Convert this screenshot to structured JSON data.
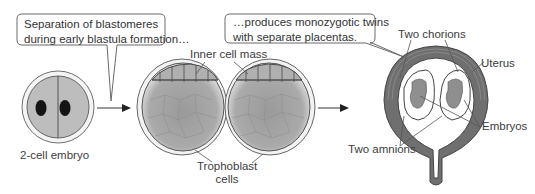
{
  "callouts": {
    "left": {
      "line1": "Separation of blastomeres",
      "line2": "during early blastula formation…"
    },
    "right": {
      "line1": "…produces monozygotic twins",
      "line2": "with separate placentas."
    }
  },
  "labels": {
    "two_cell_embryo": "2-cell embryo",
    "inner_cell_mass": "Inner cell mass",
    "trophoblast_line1": "Trophoblast",
    "trophoblast_line2": "cells",
    "two_chorions": "Two chorions",
    "uterus": "Uterus",
    "embryos": "Embryos",
    "two_amnions": "Two amnions"
  },
  "colors": {
    "cell_fill": "#b9b9b9",
    "nucleus": "#1a1a1a",
    "uterus_wall": "#6e6e6e",
    "embryo_fill": "#8f8f8f",
    "outline": "#555555"
  }
}
